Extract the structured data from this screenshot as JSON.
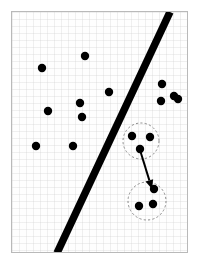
{
  "figure": {
    "width": 199,
    "height": 266,
    "background_color": "#ffffff"
  },
  "plot_area": {
    "x": 11,
    "y": 11,
    "width": 177,
    "height": 242,
    "border_color": "#b9b9b9",
    "fill_color": "#fefefe",
    "grid": true,
    "grid_color": "#cdcdcd",
    "grid_spacing": 7
  },
  "chart_data": {
    "type": "scatter",
    "title": "",
    "xlabel": "",
    "ylabel": "",
    "xlim": [
      11,
      188
    ],
    "ylim": [
      11,
      253
    ],
    "grid": true,
    "legend": "none",
    "point_color": "#000000",
    "point_radius": 4.2,
    "series": [
      {
        "name": "left-class-points",
        "color": "#000000",
        "points": [
          {
            "x": 85,
            "y": 56
          },
          {
            "x": 42,
            "y": 68
          },
          {
            "x": 109,
            "y": 92
          },
          {
            "x": 80,
            "y": 103
          },
          {
            "x": 48,
            "y": 111
          },
          {
            "x": 82,
            "y": 117
          },
          {
            "x": 36,
            "y": 146
          },
          {
            "x": 73,
            "y": 146
          }
        ]
      },
      {
        "name": "right-class-points",
        "color": "#000000",
        "points": [
          {
            "x": 174,
            "y": 96
          },
          {
            "x": 162,
            "y": 84
          },
          {
            "x": 161,
            "y": 101
          },
          {
            "x": 178,
            "y": 99
          }
        ]
      }
    ],
    "separator_line": {
      "name": "decision-boundary",
      "color": "#000000",
      "width": 7.5,
      "x1": 170,
      "y1": 12,
      "x2": 57,
      "y2": 253
    },
    "clusters": [
      {
        "name": "source-cluster",
        "center": {
          "x": 141,
          "y": 141
        },
        "radius": 18,
        "outline_color": "#8a8a8a",
        "outline_style": "dashed",
        "points": [
          {
            "x": 132,
            "y": 136
          },
          {
            "x": 150,
            "y": 137
          },
          {
            "x": 140,
            "y": 149
          }
        ]
      },
      {
        "name": "target-cluster",
        "center": {
          "x": 147,
          "y": 201
        },
        "radius": 19,
        "outline_color": "#8a8a8a",
        "outline_style": "dashed",
        "points": [
          {
            "x": 154,
            "y": 189
          },
          {
            "x": 139,
            "y": 206
          },
          {
            "x": 153,
            "y": 204
          }
        ]
      }
    ],
    "arrow": {
      "name": "cluster-transition-arrow",
      "color": "#000000",
      "width": 2,
      "x1": 140,
      "y1": 150,
      "x2": 152,
      "y2": 189,
      "head_length": 9,
      "head_width": 8
    }
  }
}
